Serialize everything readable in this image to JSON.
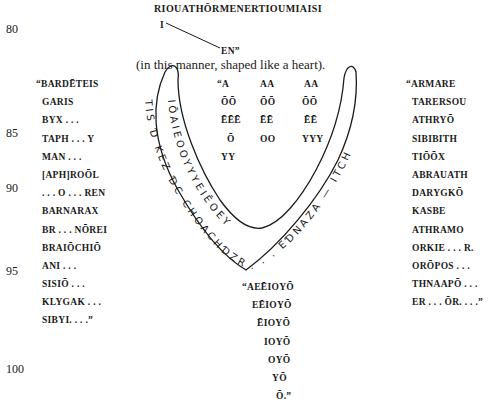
{
  "line_numbers": [
    "80",
    "85",
    "90",
    "95",
    "100"
  ],
  "header": {
    "top_line": "RIOUATHŌRMENERTIOUMIAISI",
    "diagonal_start": "I",
    "diagonal_end": "EN”",
    "caption": "(in this manner, shaped like a heart)."
  },
  "left_column": [
    "“BARDĒTEIS",
    "GARIS",
    "BYX . . .",
    "TAPH . . . Y",
    "MAN . . .",
    "[APH]ROŌL",
    ". . . O . . . REN",
    "BARNARAX",
    "BR . . . NŌREI",
    "BRAIŌCHIŌ",
    "ANI . . .",
    "SISIŌ . . .",
    "KLYGAK . . .",
    "SIBYI. . . .”"
  ],
  "center_grid": {
    "col1": [
      "“A",
      "ŌŌ",
      "ĒĒĒ",
      "Ō",
      "YY"
    ],
    "col2": [
      "AA",
      "ŌŌ",
      "ĒĒ",
      "OO"
    ],
    "col3": [
      "AA",
      "ŌŌ",
      "ĒĒ",
      "YYY"
    ]
  },
  "right_column": [
    "“ARMARE",
    "TARERSOU",
    "ATHRYŌ",
    "SIBIBITH",
    "TIŌŌX",
    "ABRAUATH",
    "DARYGKŌ",
    "KASBE",
    "ATHRAMO",
    "ORKIE . . . R.",
    "ORŌPOS . . .",
    "THNAAPŌ . . .",
    "ER . . . ŌR. . . .”"
  ],
  "heart": {
    "outer_text": "TIS Ɗ KEZ ƊC CHOACHƊZR . . . EƊNAZA — ITCHƊ",
    "inner_text": "IŌAIEOOYYYEIĒOEY"
  },
  "bottom_column": [
    "“AEĒIOYŌ",
    "EĒIOYŌ",
    "ĒIOYŌ",
    "IOYŌ",
    "OYŌ",
    "YŌ",
    "Ō.”"
  ]
}
